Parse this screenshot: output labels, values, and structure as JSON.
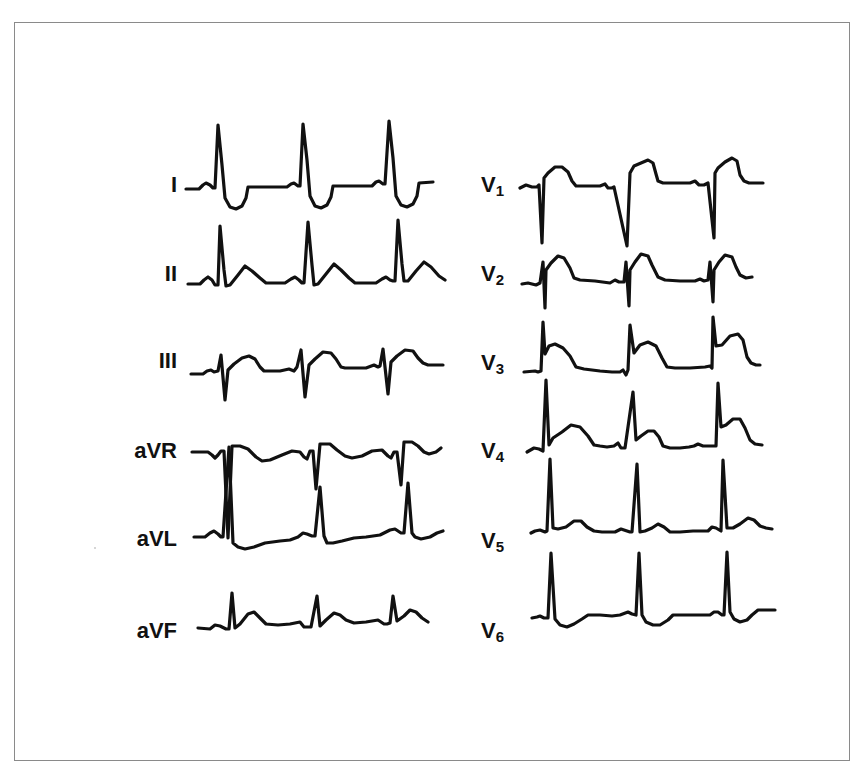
{
  "figure": {
    "title": "",
    "type": "12-lead electrocardiogram",
    "columns": [
      {
        "name": "limb-leads",
        "leads": [
          {
            "id": "I",
            "label": "I",
            "sub": ""
          },
          {
            "id": "II",
            "label": "II",
            "sub": ""
          },
          {
            "id": "III",
            "label": "III",
            "sub": ""
          },
          {
            "id": "aVR",
            "label": "aVR",
            "sub": ""
          },
          {
            "id": "aVL",
            "label": "aVL",
            "sub": ""
          },
          {
            "id": "aVF",
            "label": "aVF",
            "sub": ""
          }
        ]
      },
      {
        "name": "precordial-leads",
        "leads": [
          {
            "id": "V1",
            "label": "V",
            "sub": "1"
          },
          {
            "id": "V2",
            "label": "V",
            "sub": "2"
          },
          {
            "id": "V3",
            "label": "V",
            "sub": "3"
          },
          {
            "id": "V4",
            "label": "V",
            "sub": "4"
          },
          {
            "id": "V5",
            "label": "V",
            "sub": "5"
          },
          {
            "id": "V6",
            "label": "V",
            "sub": "6"
          }
        ]
      }
    ],
    "beats_per_lead": 3,
    "trace_color": "#111111",
    "frame_color": "#8a8a8a",
    "background": "#ffffff"
  }
}
